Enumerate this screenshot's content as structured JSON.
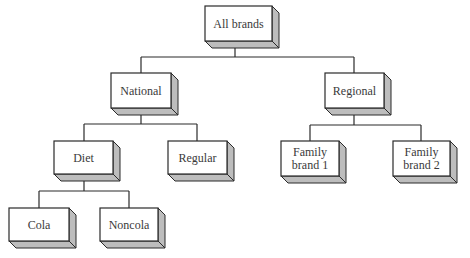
{
  "diagram": {
    "type": "tree",
    "style": {
      "line_color": "#2a2a2a",
      "box_fill": "#ffffff",
      "box_side_fill": "#bdbdbd",
      "text_color": "#3a3a3a"
    },
    "nodes": [
      {
        "id": "all",
        "label": [
          "All brands"
        ],
        "parent": null,
        "x": 205,
        "y": 6,
        "w": 67,
        "h": 35
      },
      {
        "id": "national",
        "label": [
          "National"
        ],
        "parent": "all",
        "x": 111,
        "y": 73,
        "w": 60,
        "h": 35
      },
      {
        "id": "regional",
        "label": [
          "Regional"
        ],
        "parent": "all",
        "x": 325,
        "y": 73,
        "w": 59,
        "h": 35
      },
      {
        "id": "diet",
        "label": [
          "Diet"
        ],
        "parent": "national",
        "x": 54,
        "y": 141,
        "w": 59,
        "h": 33
      },
      {
        "id": "regular",
        "label": [
          "Regular"
        ],
        "parent": "national",
        "x": 168,
        "y": 141,
        "w": 59,
        "h": 33
      },
      {
        "id": "family1",
        "label": [
          "Family",
          "brand 1"
        ],
        "parent": "regional",
        "x": 281,
        "y": 141,
        "w": 58,
        "h": 35
      },
      {
        "id": "family2",
        "label": [
          "Family",
          "brand 2"
        ],
        "parent": "regional",
        "x": 393,
        "y": 141,
        "w": 57,
        "h": 35
      },
      {
        "id": "cola",
        "label": [
          "Cola"
        ],
        "parent": "diet",
        "x": 9,
        "y": 208,
        "w": 60,
        "h": 33
      },
      {
        "id": "noncola",
        "label": [
          "Noncola"
        ],
        "parent": "diet",
        "x": 100,
        "y": 208,
        "w": 58,
        "h": 33
      }
    ],
    "connectors": [
      {
        "from": "all",
        "stem_x": 235,
        "bar_y": 57,
        "children_x": [
          141,
          354
        ]
      },
      {
        "from": "national",
        "stem_x": 141,
        "bar_y": 124,
        "children_x": [
          84,
          197
        ]
      },
      {
        "from": "regional",
        "stem_x": 354,
        "bar_y": 125,
        "children_x": [
          310,
          421
        ]
      },
      {
        "from": "diet",
        "stem_x": 84,
        "bar_y": 191,
        "children_x": [
          39,
          129
        ]
      }
    ],
    "depth": 7
  }
}
